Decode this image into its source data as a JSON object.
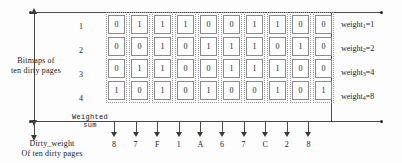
{
  "figure": {
    "left_caption_top": "Bitmaps of\nten dirty pages",
    "left_caption_bottom": "Dirty_weight\nOf ten dirty pages",
    "weighted_sum_caption": "Weighted\nsum"
  },
  "rows": [
    {
      "index": "1",
      "weight_label": "weight",
      "weight_sub": "1",
      "weight_eq": "=1",
      "weight_value": 1
    },
    {
      "index": "2",
      "weight_label": "weight",
      "weight_sub": "2",
      "weight_eq": "=2",
      "weight_value": 2
    },
    {
      "index": "3",
      "weight_label": "weight",
      "weight_sub": "3",
      "weight_eq": "=4",
      "weight_value": 4
    },
    {
      "index": "4",
      "weight_label": "weight",
      "weight_sub": "4",
      "weight_eq": "=8",
      "weight_value": 8
    }
  ],
  "chart_data": {
    "type": "table",
    "row_labels": [
      "1",
      "2",
      "3",
      "4"
    ],
    "row_weights": [
      1,
      2,
      4,
      8
    ],
    "column_count": 10,
    "bitmap_rows": [
      [
        "0",
        "1",
        "1",
        "1",
        "0",
        "0",
        "1",
        "1",
        "0",
        "0"
      ],
      [
        "0",
        "0",
        "1",
        "0",
        "1",
        "1",
        "1",
        "0",
        "1",
        "0"
      ],
      [
        "0",
        "1",
        "1",
        "0",
        "0",
        "1",
        "1",
        "1",
        "0",
        "0"
      ],
      [
        "1",
        "0",
        "1",
        "0",
        "1",
        "0",
        "0",
        "1",
        "0",
        "1"
      ]
    ],
    "weighted_sums": [
      "8",
      "7",
      "F",
      "1",
      "A",
      "6",
      "7",
      "C",
      "2",
      "8"
    ],
    "xlabel": "Dirty_weight Of ten dirty pages",
    "ylabel": "Bitmaps of ten dirty pages",
    "legend": [
      "weight1=1",
      "weight2=2",
      "weight3=4",
      "weight4=8"
    ],
    "grid": false
  }
}
